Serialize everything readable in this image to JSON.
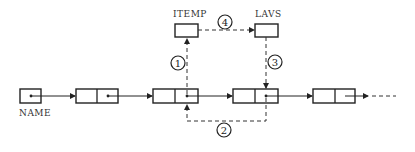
{
  "diagram": {
    "type": "linked-list-insertion",
    "labels": {
      "name": "NAME",
      "itemp": "ITEMP",
      "lavs": "LAVS"
    },
    "steps": [
      {
        "id": "1",
        "label": "1",
        "from": "node-2-pointer",
        "to": "itemp"
      },
      {
        "id": "2",
        "label": "2",
        "from": "node-3-pointer",
        "to": "node-2-pointer"
      },
      {
        "id": "3",
        "label": "3",
        "from": "lavs",
        "to": "node-3-pointer"
      },
      {
        "id": "4",
        "label": "4",
        "from": "itemp",
        "to": "lavs"
      }
    ],
    "nodes": [
      "name-pointer",
      "node-1",
      "node-2",
      "node-3",
      "node-4"
    ],
    "colors": {
      "line": "#222222",
      "background": "#ffffff"
    }
  }
}
